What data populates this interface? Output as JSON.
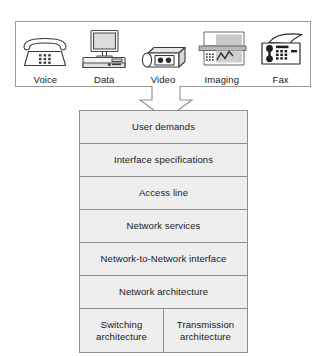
{
  "diagram": {
    "services_panel": {
      "name": "service-types-panel",
      "items": [
        {
          "label": "Voice",
          "icon": "telephone-icon"
        },
        {
          "label": "Data",
          "icon": "desktop-computer-icon"
        },
        {
          "label": "Video",
          "icon": "video-camera-icon"
        },
        {
          "label": "Imaging",
          "icon": "image-scanner-icon"
        },
        {
          "label": "Fax",
          "icon": "fax-machine-icon"
        }
      ]
    },
    "connector": {
      "icon": "down-arrow-icon",
      "direction": "down"
    },
    "layers": [
      {
        "label": "User demands"
      },
      {
        "label": "Interface specifications"
      },
      {
        "label": "Access line"
      },
      {
        "label": "Network services"
      },
      {
        "label": "Network-to-Network interface"
      },
      {
        "label": "Network architecture"
      }
    ],
    "bottom_layer": {
      "cells": [
        {
          "label": "Switching architecture"
        },
        {
          "label": "Transmission architecture"
        }
      ]
    },
    "colors": {
      "layer_fill": "#eeeeee",
      "layer_border": "#8f8f8f",
      "panel_border": "#9a9a9a",
      "panel_fill": "#ffffff",
      "arrow_stroke": "#8f8f8f",
      "text": "#1a1a1a"
    }
  }
}
